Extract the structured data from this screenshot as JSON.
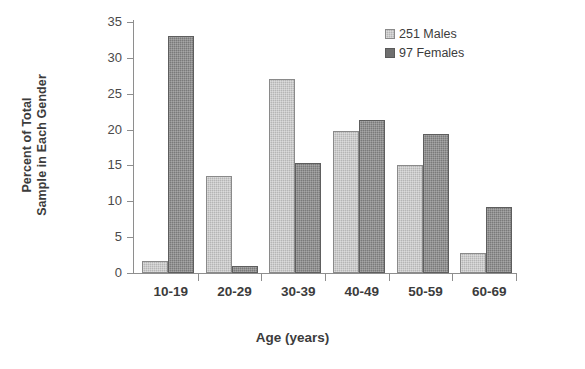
{
  "chart_data": {
    "type": "bar",
    "title": "",
    "subtitle": "",
    "xlabel": "Age (years)",
    "ylabel": "Percent of Total Sample in Each Gender",
    "ylabel_lines": [
      "Percent of Total",
      "Sample in Each Gender"
    ],
    "categories": [
      "10-19",
      "20-29",
      "30-39",
      "40-49",
      "50-59",
      "60-69"
    ],
    "series": [
      {
        "name": "251 Males",
        "color": "#b5b5b5",
        "values": [
          1.7,
          13.5,
          27.0,
          19.8,
          15.0,
          2.8
        ]
      },
      {
        "name": "97 Females",
        "color": "#7a7a7a",
        "values": [
          33.0,
          1.0,
          15.4,
          21.4,
          19.4,
          9.2
        ]
      }
    ],
    "ylim": [
      0,
      35
    ],
    "ytick_values": [
      0,
      5,
      10,
      15,
      20,
      25,
      30,
      35
    ],
    "ytick_labels": [
      "0",
      "5",
      "10",
      "15",
      "20",
      "25",
      "30",
      "35"
    ],
    "grid": false,
    "legend_position": "top-right"
  },
  "legend": {
    "items": [
      {
        "label": "251 Males",
        "swatch": "legend-swatch-males"
      },
      {
        "label": "97 Females",
        "swatch": "legend-swatch-females"
      }
    ]
  }
}
